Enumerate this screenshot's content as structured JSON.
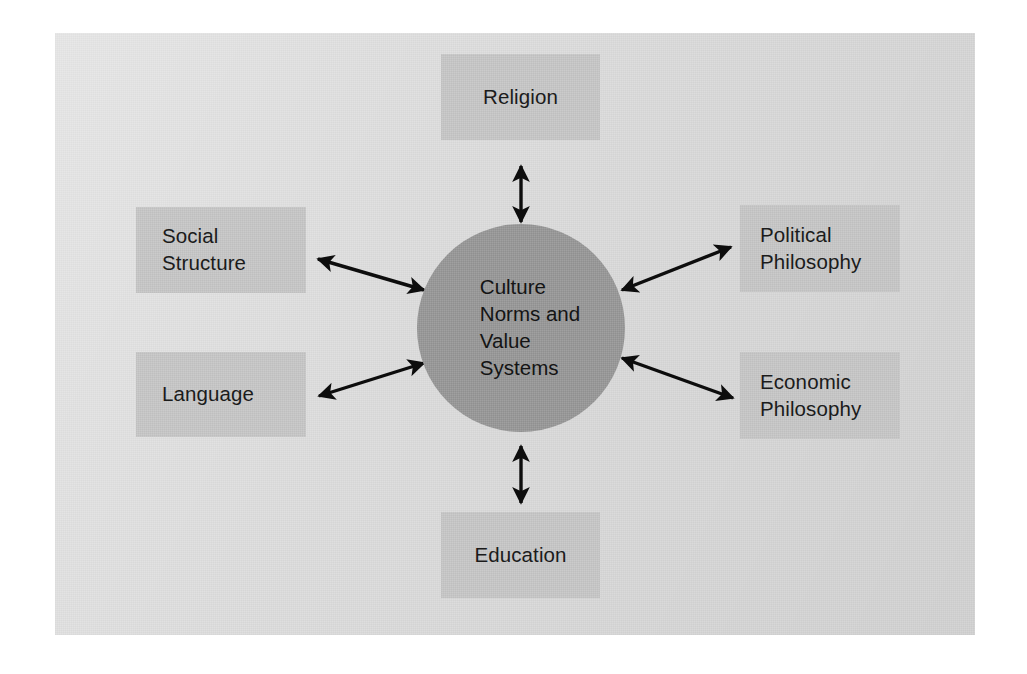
{
  "figure": {
    "type": "hub-and-spoke-diagram",
    "center": {
      "label": "Culture\nNorms and\nValue\nSystems",
      "shape": "circle",
      "fill_color": "#9a9a9a"
    },
    "panel": {
      "background_color": "#dcdcdc",
      "page_background_color": "#ffffff"
    },
    "node_fill_color": "#c9c9c9",
    "arrow_color": "#000000",
    "nodes": [
      {
        "id": "religion",
        "label": "Religion",
        "position": "top"
      },
      {
        "id": "political",
        "label": "Political\nPhilosophy",
        "position": "right-upper"
      },
      {
        "id": "economic",
        "label": "Economic\nPhilosophy",
        "position": "right-lower"
      },
      {
        "id": "education",
        "label": "Education",
        "position": "bottom"
      },
      {
        "id": "language",
        "label": "Language",
        "position": "left-lower"
      },
      {
        "id": "social",
        "label": "Social\nStructure",
        "position": "left-upper"
      }
    ],
    "connectors": [
      {
        "from": "religion",
        "to": "center",
        "style": "double-headed-arrow"
      },
      {
        "from": "social",
        "to": "center",
        "style": "double-headed-arrow"
      },
      {
        "from": "language",
        "to": "center",
        "style": "double-headed-arrow"
      },
      {
        "from": "political",
        "to": "center",
        "style": "double-headed-arrow"
      },
      {
        "from": "economic",
        "to": "center",
        "style": "double-headed-arrow"
      },
      {
        "from": "education",
        "to": "center",
        "style": "double-headed-arrow"
      }
    ]
  }
}
